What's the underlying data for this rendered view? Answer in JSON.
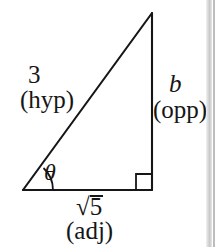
{
  "figure": {
    "stroke_color": "#161616",
    "background_color": "#ffffff",
    "page_edge_color": "#c9c9c9"
  },
  "geometry": {
    "vertices": {
      "left": [
        23,
        190
      ],
      "right": [
        152,
        190
      ],
      "apex": [
        152,
        13
      ]
    },
    "right_angle_marker": {
      "at": [
        152,
        190
      ],
      "size": 16
    },
    "angle_arc": {
      "at": [
        23,
        190
      ],
      "radius": 30
    }
  },
  "labels": {
    "hypotenuse": {
      "value": "3",
      "role": "(hyp)",
      "radical": false
    },
    "opposite": {
      "value": "b",
      "role": "(opp)",
      "radical": false
    },
    "adjacent": {
      "radical_symbol": "√",
      "radicand": "5",
      "role": "(adj)",
      "radical": true
    },
    "angle": {
      "symbol": "θ"
    }
  }
}
